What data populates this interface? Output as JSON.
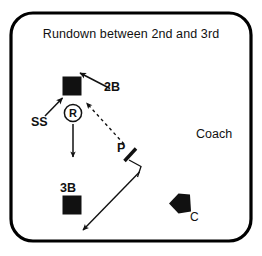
{
  "diagram": {
    "title": "Rundown between 2nd and 3rd",
    "type": "baseball-play-diagram",
    "colors": {
      "ink": "#111111",
      "frame": "#000000",
      "background": "#ffffff"
    },
    "frame": {
      "shape": "rounded-rectangle",
      "x": 11,
      "y": 13,
      "width": 240,
      "height": 228,
      "corner_radius": 22,
      "stroke_width": 3.2
    },
    "labels": {
      "second_base": "2B",
      "shortstop": "SS",
      "third_base": "3B",
      "pitcher": "P",
      "catcher": "C",
      "coach": "Coach",
      "runner": "R"
    },
    "markers": [
      {
        "name": "second-base-bag",
        "symbol": "filled-square",
        "x": 72,
        "y": 86,
        "size": 19
      },
      {
        "name": "third-base-bag",
        "symbol": "filled-square",
        "x": 72,
        "y": 205,
        "size": 19
      },
      {
        "name": "runner-marker",
        "symbol": "circled-letter",
        "letter": "R",
        "x": 73,
        "y": 113,
        "radius": 9
      },
      {
        "name": "catcher-marker",
        "symbol": "home-plate-pentagon",
        "x": 179,
        "y": 203
      },
      {
        "name": "pitcher-marker",
        "symbol": "diagonal-tick",
        "x": 130,
        "y": 155
      }
    ],
    "paths": [
      {
        "name": "second-baseman-approach-arrow",
        "style": "solid",
        "arrow": "end",
        "from": [
          110,
          88
        ],
        "to": [
          79,
          73
        ]
      },
      {
        "name": "shortstop-approach-arrow",
        "style": "solid",
        "arrow": "end",
        "from": [
          45,
          116
        ],
        "to": [
          62,
          98
        ]
      },
      {
        "name": "runner-retreat-arrow",
        "style": "solid",
        "arrow": "end",
        "from": [
          73,
          124
        ],
        "to": [
          73,
          157
        ]
      },
      {
        "name": "pitcher-throw-dashed",
        "style": "dashed",
        "arrow": "end",
        "from": [
          124,
          144
        ],
        "to": [
          86,
          103
        ]
      },
      {
        "name": "pitcher-cover-elbow",
        "style": "solid",
        "arrow": "none",
        "points": [
          [
            129,
            160
          ],
          [
            140,
            166
          ],
          [
            137,
            176
          ]
        ]
      },
      {
        "name": "pitcher-break-to-third-arrow",
        "style": "solid",
        "arrow": "end",
        "from": [
          139,
          172
        ],
        "to": [
          83,
          230
        ]
      }
    ]
  }
}
